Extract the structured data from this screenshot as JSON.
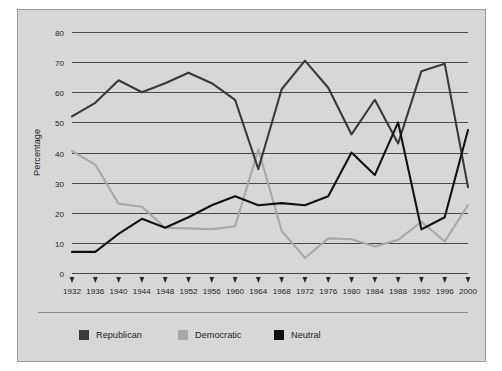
{
  "chart_data": {
    "type": "line",
    "title": "",
    "subtitle": "",
    "xlabel": "",
    "ylabel": "Percentage",
    "xlim": [
      1932,
      2000
    ],
    "ylim": [
      0,
      80
    ],
    "ytick_step": 10,
    "grid": true,
    "grid_axis": "y",
    "legend_position": "bottom-left",
    "categories": [
      "1932",
      "1936",
      "1940",
      "1944",
      "1948",
      "1952",
      "1956",
      "1960",
      "1964",
      "1968",
      "1972",
      "1976",
      "1980",
      "1984",
      "1988",
      "1992",
      "1996",
      "2000"
    ],
    "yticks": [
      "0",
      "10",
      "20",
      "30",
      "40",
      "50",
      "60",
      "70",
      "80"
    ],
    "series": [
      {
        "name": "Republican",
        "color": "#3a3a3a",
        "values": [
          52,
          56.5,
          64,
          60,
          63,
          66.5,
          63,
          57.5,
          34.5,
          61,
          70.5,
          61.5,
          46,
          57.5,
          43,
          67,
          69.5,
          28.5
        ]
      },
      {
        "name": "Democratic",
        "color": "#a8a8a8",
        "values": [
          40.5,
          36,
          23,
          22,
          15,
          14.8,
          14.5,
          15.5,
          41,
          14,
          5,
          11.5,
          11.2,
          8.8,
          11,
          17,
          10.5,
          22.5
        ]
      },
      {
        "name": "Neutral",
        "color": "#111111",
        "values": [
          7,
          7,
          13,
          18,
          15,
          18.5,
          22.5,
          25.5,
          22.5,
          23.2,
          22.5,
          25.5,
          40,
          32.5,
          50,
          14.5,
          18.5,
          47.5
        ]
      }
    ]
  },
  "legend": {
    "items": [
      {
        "label": "Republican",
        "color": "#3a3a3a"
      },
      {
        "label": "Democratic",
        "color": "#a8a8a8"
      },
      {
        "label": "Neutral",
        "color": "#111111"
      }
    ]
  },
  "colors": {
    "plate_background": "#d7d7d7",
    "plate_border": "#9a9a9a",
    "gridline": "#4a4a4a",
    "text": "#1d1d1d",
    "republican": "#3a3a3a",
    "democratic": "#a8a8a8",
    "neutral": "#111111"
  }
}
